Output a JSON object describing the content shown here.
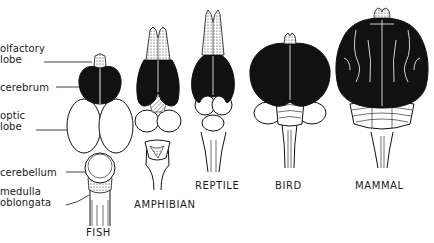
{
  "figure": {
    "structure_labels": [
      {
        "id": "olfactory",
        "text": "olfactory\nlobe"
      },
      {
        "id": "cerebrum",
        "text": "cerebrum"
      },
      {
        "id": "optic",
        "text": "optic\nlobe"
      },
      {
        "id": "cerebellum",
        "text": "cerebellum"
      },
      {
        "id": "medulla",
        "text": "medulla\noblongata"
      }
    ],
    "specimens": [
      {
        "id": "fish",
        "caption": "FISH"
      },
      {
        "id": "amphibian",
        "caption": "AMPHIBIAN"
      },
      {
        "id": "reptile",
        "caption": "REPTILE"
      },
      {
        "id": "bird",
        "caption": "BIRD"
      },
      {
        "id": "mammal",
        "caption": "MAMMAL"
      }
    ],
    "colors": {
      "ink": "#111111",
      "paper": "#ffffff"
    }
  }
}
